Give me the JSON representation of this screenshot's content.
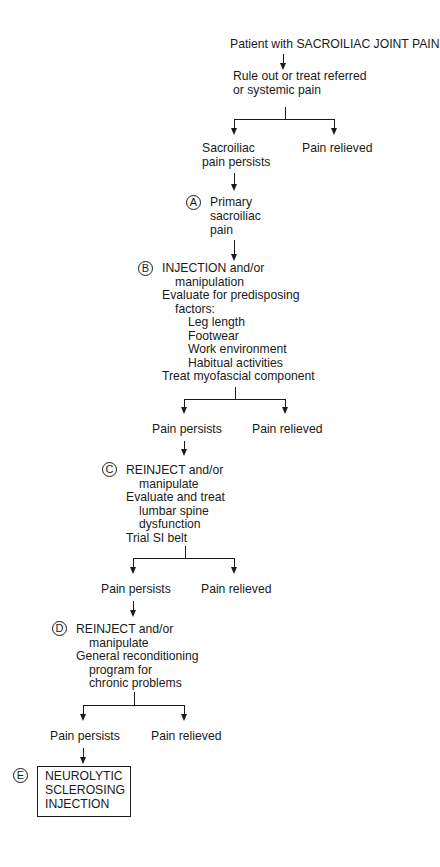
{
  "flowchart": {
    "title": "Patient with SACROILIAC JOINT PAIN",
    "step0": {
      "lines": [
        "Rule out or treat referred",
        "or systemic pain"
      ],
      "branches": {
        "left": [
          "Sacroiliac",
          "pain persists"
        ],
        "right": "Pain relieved"
      }
    },
    "stepA": {
      "marker": "A",
      "lines": [
        "Primary",
        "sacroiliac",
        "pain"
      ]
    },
    "stepB": {
      "marker": "B",
      "lines": [
        "INJECTION and/or",
        "manipulation",
        "Evaluate for predisposing",
        "factors:",
        "Leg length",
        "Footwear",
        "Work environment",
        "Habitual activities",
        "Treat myofascial component"
      ],
      "branches": {
        "left": "Pain persists",
        "right": "Pain relieved"
      }
    },
    "stepC": {
      "marker": "C",
      "lines": [
        "REINJECT and/or",
        "manipulate",
        "Evaluate and treat",
        "lumbar spine",
        "dysfunction",
        "Trial SI belt"
      ],
      "branches": {
        "left": "Pain persists",
        "right": "Pain relieved"
      }
    },
    "stepD": {
      "marker": "D",
      "lines": [
        "REINJECT and/or",
        "manipulate",
        "General reconditioning",
        "program for",
        "chronic problems"
      ],
      "branches": {
        "left": "Pain persists",
        "right": "Pain relieved"
      }
    },
    "stepE": {
      "marker": "E",
      "lines": [
        "NEUROLYTIC",
        "SCLEROSING",
        "INJECTION"
      ]
    }
  }
}
